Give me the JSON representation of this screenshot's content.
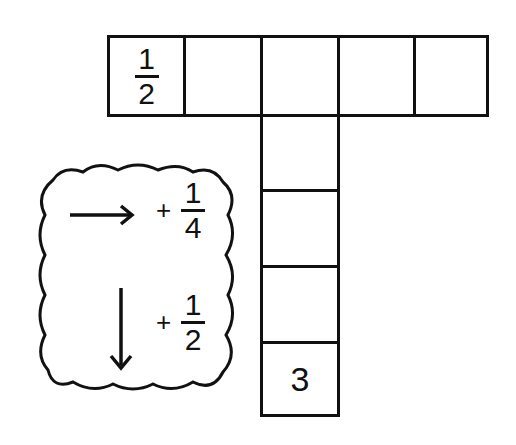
{
  "puzzle": {
    "horizontal_cells": [
      {
        "num": "1",
        "den": "2"
      },
      {
        "value": ""
      },
      {
        "value": ""
      },
      {
        "value": ""
      },
      {
        "value": ""
      }
    ],
    "vertical_cells": [
      {
        "value": ""
      },
      {
        "value": ""
      },
      {
        "value": ""
      },
      {
        "value": "3"
      }
    ],
    "first_num": "1",
    "first_den": "2",
    "last_value": "3"
  },
  "rules": {
    "across": {
      "direction": "right-arrow",
      "op": "+",
      "num": "1",
      "den": "4"
    },
    "down": {
      "direction": "down-arrow",
      "op": "+",
      "num": "1",
      "den": "2"
    }
  }
}
